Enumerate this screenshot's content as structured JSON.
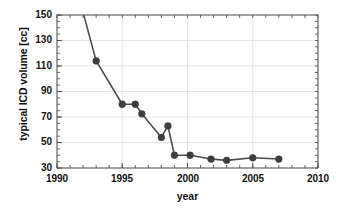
{
  "chart_data": {
    "type": "line",
    "title": "",
    "xlabel": "year",
    "ylabel": "typical ICD volume [cc]",
    "xlim": [
      1990,
      2010
    ],
    "ylim": [
      30,
      150
    ],
    "xticks": [
      1990,
      1995,
      2000,
      2005,
      2010
    ],
    "yticks": [
      30,
      50,
      70,
      90,
      110,
      130,
      150
    ],
    "grid": true,
    "legend": "none",
    "marker": "filled-circle",
    "series": [
      {
        "name": "typical ICD volume",
        "color": "#4d4d4d",
        "x": [
          1992.0,
          1993.0,
          1995.0,
          1996.0,
          1996.5,
          1998.0,
          1998.5,
          1999.0,
          2000.2,
          2001.8,
          2003.0,
          2005.0,
          2007.0
        ],
        "y": [
          152.0,
          114.0,
          80.0,
          80.0,
          72.5,
          54.0,
          63.0,
          40.0,
          40.0,
          37.0,
          36.0,
          38.0,
          37.0
        ],
        "markers_visible": [
          false,
          true,
          true,
          true,
          true,
          true,
          true,
          true,
          true,
          true,
          true,
          true,
          true
        ]
      }
    ]
  },
  "axis": {
    "y_tick_labels": [
      "150",
      "130",
      "110",
      "90",
      "70",
      "50",
      "30"
    ],
    "x_tick_labels": [
      "1990",
      "1995",
      "2000",
      "2005",
      "2010"
    ]
  },
  "style": {
    "line_color": "#4d4d4d",
    "marker_color": "#3d3d3d",
    "axis_color": "#555555",
    "grid_color": "#e3e3e8",
    "background": "#ffffff",
    "text_color": "#111111"
  }
}
